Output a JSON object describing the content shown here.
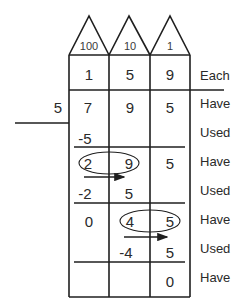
{
  "diagram": {
    "type": "division-place-value-chart",
    "divisor": "5",
    "place_values": [
      "100",
      "10",
      "1"
    ],
    "rows": [
      {
        "label": "Each",
        "cells": [
          "1",
          "5",
          "9"
        ]
      },
      {
        "label": "Have",
        "cells": [
          "7",
          "9",
          "5"
        ]
      },
      {
        "label": "Used",
        "cells": [
          "-5",
          "",
          ""
        ]
      },
      {
        "label": "Have",
        "cells": [
          "2",
          "9",
          "5"
        ]
      },
      {
        "label": "Used",
        "cells": [
          "-2",
          "5",
          ""
        ]
      },
      {
        "label": "Have",
        "cells": [
          "0",
          "4",
          "5"
        ]
      },
      {
        "label": "Used",
        "cells": [
          "",
          "-4",
          "5"
        ]
      },
      {
        "label": "Have",
        "cells": [
          "",
          "",
          "0"
        ]
      }
    ],
    "annotations": [
      {
        "type": "ellipse",
        "around": [
          "2",
          "9"
        ],
        "row": 3
      },
      {
        "type": "arrow",
        "from_col": "100",
        "to_col": "10",
        "row": 4
      },
      {
        "type": "ellipse",
        "around": [
          "4",
          "5"
        ],
        "row": 5
      },
      {
        "type": "arrow",
        "from_col": "10",
        "to_col": "1",
        "row": 6
      }
    ]
  }
}
